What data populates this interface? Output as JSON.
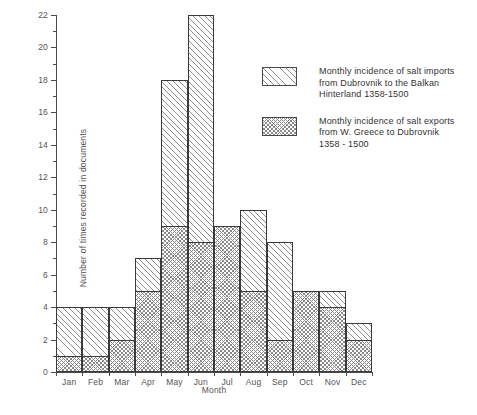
{
  "chart_data": {
    "type": "bar",
    "title": "",
    "subtitle": "",
    "xlabel": "Month",
    "ylabel": "Number of times recorded in documents",
    "categories": [
      "Jan",
      "Feb",
      "Mar",
      "Apr",
      "May",
      "Jun",
      "Jul",
      "Aug",
      "Sep",
      "Oct",
      "Nov",
      "Dec"
    ],
    "series": [
      {
        "name": "Monthly incidence of salt imports from Dubrovnik to the Balkan Hinterland 1358-1500",
        "key": "imports",
        "values": [
          4,
          4,
          4,
          7,
          18,
          22,
          9,
          10,
          8,
          5,
          5,
          3
        ]
      },
      {
        "name": "Monthly incidence of salt exports from W. Greece to Dubrovnik 1358-1500",
        "key": "exports",
        "values": [
          1,
          1,
          2,
          5,
          9,
          8,
          9,
          5,
          2,
          5,
          4,
          2
        ]
      }
    ],
    "ylim": [
      0,
      22
    ],
    "ytick_step": 2,
    "yticks": [
      0,
      2,
      4,
      6,
      8,
      10,
      12,
      14,
      16,
      18,
      20,
      22
    ],
    "ytick_labels": [
      "0",
      "2",
      "4",
      "6",
      "8",
      "10",
      "12",
      "14",
      "16",
      "18",
      "20",
      "22"
    ],
    "grid": false,
    "legend_position": "upper-right-inside",
    "overlap_style": "overlaid-step-histogram"
  },
  "legend": {
    "entries": [
      {
        "swatch": "sparse-diagonal-hatch",
        "line1": "Monthly incidence of salt imports",
        "line2": "from Dubrovnik to the Balkan",
        "line3": "Hinterland 1358-1500",
        "text": "Monthly incidence of salt imports\n from Dubrovnik to the Balkan\n Hinterland 1358-1500"
      },
      {
        "swatch": "dense-cross-hatch",
        "line1": "Monthly incidence of salt exports",
        "line2": "from W. Greece to Dubrovnik",
        "line3": "1358 - 1500",
        "text": "Monthly incidence of salt exports\n from W. Greece to Dubrovnik\n 1358 - 1500"
      }
    ]
  },
  "colors": {
    "background": "#ffffff",
    "axis": "#4a4a4a",
    "bar_outline": "#3a3a3a",
    "hatch": "#8e8e8e",
    "text": "#555555"
  }
}
